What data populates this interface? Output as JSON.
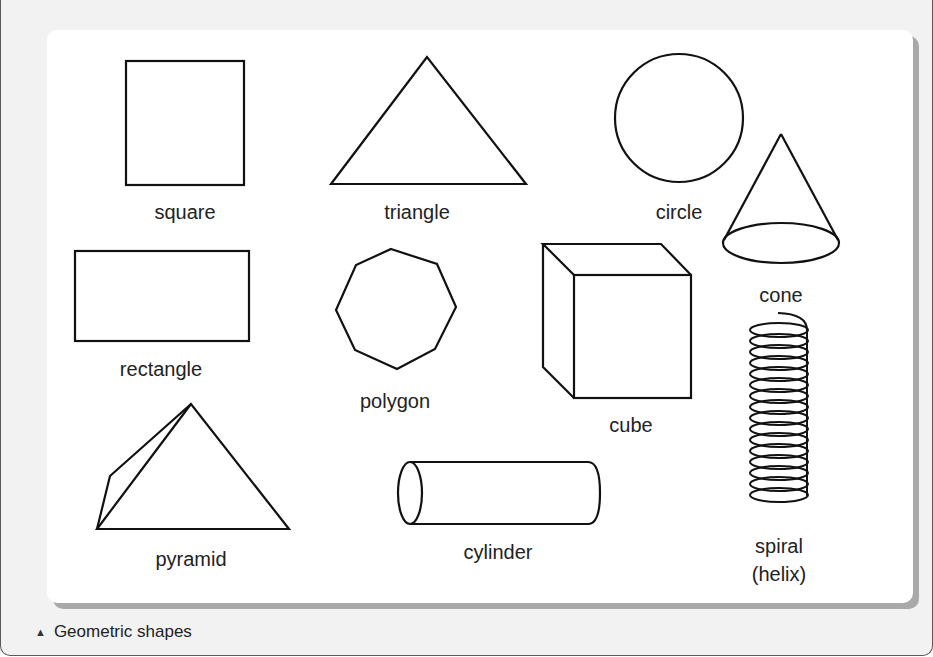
{
  "figure": {
    "caption_icon": "▲",
    "caption": "Geometric shapes",
    "stroke_color": "#111111",
    "panel_color": "#ffffff",
    "background_color": "#f2f2f2",
    "shadow_color": "#a9a9a9"
  },
  "shapes": {
    "square": {
      "label": "square"
    },
    "triangle": {
      "label": "triangle"
    },
    "circle": {
      "label": "circle"
    },
    "cone": {
      "label": "cone"
    },
    "rectangle": {
      "label": "rectangle"
    },
    "polygon": {
      "label": "polygon"
    },
    "cube": {
      "label": "cube"
    },
    "spiral": {
      "label_line1": "spiral",
      "label_line2": "(helix)"
    },
    "pyramid": {
      "label": "pyramid"
    },
    "cylinder": {
      "label": "cylinder"
    }
  }
}
